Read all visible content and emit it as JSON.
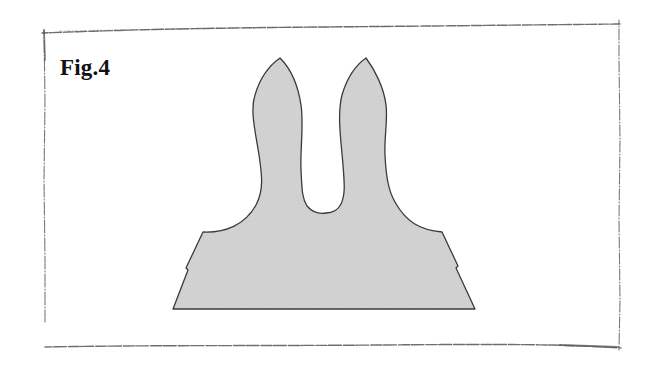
{
  "figure": {
    "label": "Fig.4",
    "shape_name": "two-lobed silhouette",
    "colors": {
      "fill": "#d2d2d2",
      "stroke": "#3a3a3a",
      "frame": "#555555",
      "background": "#ffffff"
    }
  }
}
